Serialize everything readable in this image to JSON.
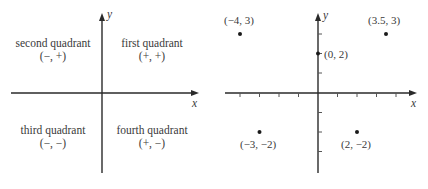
{
  "left_diagram": {
    "x_axis_label": "x",
    "y_axis_label": "y",
    "quadrants": [
      {
        "name": "second quadrant",
        "signs": "(−, +)"
      },
      {
        "name": "first quadrant",
        "signs": "(+, +)"
      },
      {
        "name": "third quadrant",
        "signs": "(−, −)"
      },
      {
        "name": "fourth quadrant",
        "signs": "(+, −)"
      }
    ]
  },
  "right_diagram": {
    "x_axis_label": "x",
    "y_axis_label": "y",
    "points": [
      {
        "label": "(−4, 3)",
        "x": -4,
        "y": 3
      },
      {
        "label": "(3.5, 3)",
        "x": 3.5,
        "y": 3
      },
      {
        "label": "(0, 2)",
        "x": 0,
        "y": 2
      },
      {
        "label": "(−3, −2)",
        "x": -3,
        "y": -2
      },
      {
        "label": "(2, −2)",
        "x": 2,
        "y": -2
      }
    ]
  }
}
